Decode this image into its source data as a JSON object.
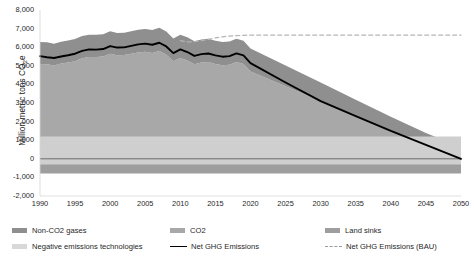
{
  "chart_data": {
    "type": "area",
    "title": "",
    "xlabel": "",
    "ylabel": "Million metric tons CO2e",
    "ylabel_prefix": "Million metric tons CO",
    "ylabel_sub": "2",
    "ylabel_suffix": "e",
    "xlim": [
      1990,
      2050
    ],
    "ylim": [
      -2000,
      8000
    ],
    "grid": false,
    "legend_position": "bottom",
    "y_ticks": [
      "8,000",
      "7,000",
      "6,000",
      "5,000",
      "4,000",
      "3,000",
      "2,000",
      "1,000",
      "0",
      "-1,000",
      "-2,000"
    ],
    "y_tick_values": [
      8000,
      7000,
      6000,
      5000,
      4000,
      3000,
      2000,
      1000,
      0,
      -1000,
      -2000
    ],
    "x_ticks": [
      "1990",
      "1995",
      "2000",
      "2005",
      "2010",
      "2015",
      "2020",
      "2025",
      "2030",
      "2035",
      "2040",
      "2045",
      "2050"
    ],
    "x_tick_values": [
      1990,
      1995,
      2000,
      2005,
      2010,
      2015,
      2020,
      2025,
      2030,
      2035,
      2040,
      2045,
      2050
    ],
    "x": [
      1990,
      1991,
      1992,
      1993,
      1994,
      1995,
      1996,
      1997,
      1998,
      1999,
      2000,
      2001,
      2002,
      2003,
      2004,
      2005,
      2006,
      2007,
      2008,
      2009,
      2010,
      2011,
      2012,
      2013,
      2014,
      2015,
      2016,
      2017,
      2018,
      2019,
      2020,
      2025,
      2030,
      2035,
      2040,
      2045,
      2050
    ],
    "series": [
      {
        "name": "CO2",
        "color": "#a8a8a8",
        "values": [
          5100,
          5080,
          5020,
          5120,
          5180,
          5250,
          5400,
          5470,
          5470,
          5500,
          5650,
          5570,
          5580,
          5650,
          5720,
          5750,
          5690,
          5790,
          5590,
          5240,
          5420,
          5280,
          5080,
          5180,
          5200,
          5100,
          5030,
          5060,
          5200,
          5100,
          4700,
          3900,
          3100,
          2300,
          1500,
          750,
          100
        ]
      },
      {
        "name": "Non-CO2 gases",
        "color": "#8f8f8f",
        "values": [
          1180,
          1180,
          1170,
          1170,
          1180,
          1190,
          1200,
          1200,
          1200,
          1200,
          1210,
          1200,
          1200,
          1210,
          1220,
          1230,
          1240,
          1250,
          1250,
          1230,
          1250,
          1250,
          1240,
          1240,
          1250,
          1250,
          1250,
          1250,
          1260,
          1250,
          1230,
          1120,
          1000,
          880,
          760,
          640,
          520
        ]
      },
      {
        "name": "Land sinks",
        "color": "#9e9e9e",
        "values": [
          -790,
          -790,
          -790,
          -790,
          -790,
          -790,
          -790,
          -790,
          -790,
          -790,
          -790,
          -790,
          -790,
          -790,
          -790,
          -790,
          -790,
          -790,
          -790,
          -790,
          -790,
          -790,
          -790,
          -790,
          -790,
          -790,
          -790,
          -790,
          -790,
          -790,
          -790,
          -790,
          -790,
          -790,
          -790,
          -790,
          -790
        ]
      },
      {
        "name": "Negative emissions technologies",
        "color": "#cfcfcf",
        "values": [
          0,
          0,
          0,
          0,
          0,
          0,
          0,
          0,
          0,
          0,
          0,
          0,
          0,
          0,
          0,
          0,
          0,
          0,
          0,
          0,
          0,
          0,
          0,
          0,
          0,
          0,
          0,
          0,
          0,
          0,
          0,
          0,
          0,
          0,
          0,
          0,
          0
        ]
      }
    ],
    "lines": [
      {
        "name": "Net GHG Emissions",
        "color": "#000000",
        "style": "solid",
        "values": [
          5520,
          5460,
          5420,
          5500,
          5570,
          5650,
          5800,
          5880,
          5870,
          5900,
          6060,
          5980,
          5990,
          6070,
          6150,
          6190,
          6130,
          6240,
          6040,
          5680,
          5880,
          5740,
          5530,
          5630,
          5660,
          5560,
          5490,
          5520,
          5670,
          5560,
          5140,
          4100,
          3100,
          2300,
          1500,
          750,
          0
        ]
      },
      {
        "name": "Net GHG Emissions (BAU)",
        "color": "#b5b5b5",
        "style": "dashed",
        "values": [
          null,
          null,
          null,
          null,
          null,
          null,
          null,
          null,
          null,
          null,
          null,
          null,
          null,
          null,
          null,
          null,
          null,
          null,
          null,
          null,
          6350,
          6280,
          6300,
          6350,
          6420,
          6500,
          6560,
          6600,
          6620,
          6640,
          6650,
          6650,
          6650,
          6650,
          6650,
          6650,
          6650
        ]
      }
    ],
    "legend": [
      {
        "label": "Non-CO2 gases",
        "type": "swatch",
        "color": "#8f8f8f"
      },
      {
        "label": "CO2",
        "type": "swatch",
        "color": "#a8a8a8"
      },
      {
        "label": "Land sinks",
        "type": "swatch",
        "color": "#9e9e9e"
      },
      {
        "label": "Negative emissions technologies",
        "type": "swatch",
        "color": "#d8d8d8"
      },
      {
        "label": "Net GHG Emissions",
        "type": "line",
        "color": "#000000"
      },
      {
        "label": "Net GHG Emissions (BAU)",
        "type": "dash",
        "color": "#9a9a9a"
      }
    ]
  }
}
